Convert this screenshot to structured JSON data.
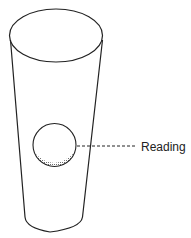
{
  "diagram": {
    "type": "tapered-tube-flowmeter",
    "components": {
      "tube": {
        "label": ""
      },
      "float_ball": {
        "label": ""
      },
      "reading_label": {
        "text": "Reading"
      }
    },
    "colors": {
      "stroke": "#222222",
      "shade": "#888888",
      "background": "#ffffff"
    }
  }
}
